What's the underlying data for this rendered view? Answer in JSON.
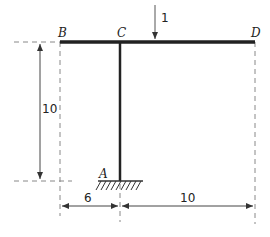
{
  "diagram": {
    "type": "structural-frame",
    "nodes": [
      {
        "id": "B",
        "label": "B",
        "x": 60,
        "y": 42
      },
      {
        "id": "C",
        "label": "C",
        "x": 120,
        "y": 42
      },
      {
        "id": "D",
        "label": "D",
        "x": 255,
        "y": 42
      },
      {
        "id": "A",
        "label": "A",
        "x": 120,
        "y": 181,
        "support": "fixed"
      }
    ],
    "members": [
      {
        "from": "B",
        "to": "D"
      },
      {
        "from": "C",
        "to": "A"
      }
    ],
    "load": {
      "label": "1",
      "direction": "down",
      "x": 155
    },
    "dimensions": {
      "height": {
        "label": "10"
      },
      "left_span": {
        "label": "6"
      },
      "right_span": {
        "label": "10"
      }
    },
    "colors": {
      "member": "#222222",
      "dim": "#444444",
      "dash": "#888888"
    }
  }
}
